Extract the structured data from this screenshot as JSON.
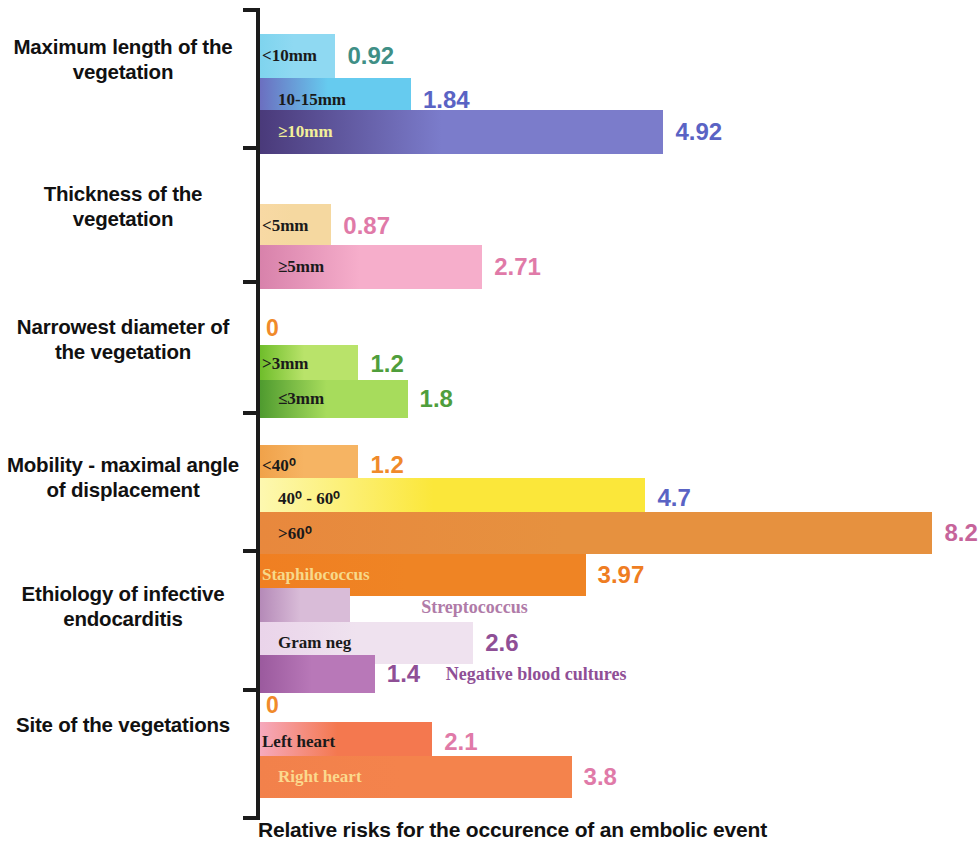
{
  "chart_data": {
    "type": "bar",
    "orientation": "horizontal",
    "title": "",
    "xlabel": "Relative risks for the occurence of an embolic event",
    "ylabel": "",
    "xlim": [
      0,
      8.8
    ],
    "grid": false,
    "legend": "none",
    "groups": [
      {
        "category": "Maximum length of the vegetation",
        "zero_marker": "",
        "bars": [
          {
            "label": "<10mm",
            "value": 0.92,
            "value_text": "0.92",
            "label_color": "#1a1a1a",
            "value_color": "#3f8f86",
            "bar_from": "#7fd4ee",
            "bar_to": "#8fd9f2"
          },
          {
            "label": "10-15mm",
            "value": 1.84,
            "value_text": "1.84",
            "label_color": "#1a1a1a",
            "value_color": "#5a63c4",
            "bar_from": "#6b6fc0",
            "bar_to": "#66cbef"
          },
          {
            "label": "≥10mm",
            "value": 4.92,
            "value_text": "4.92",
            "label_color": "#f2ef9a",
            "value_color": "#5a63c4",
            "bar_from": "#4a3a7a",
            "bar_to": "#7b7ccb"
          }
        ]
      },
      {
        "category": "Thickness of the vegetation",
        "zero_marker": "",
        "bars": [
          {
            "label": "<5mm",
            "value": 0.87,
            "value_text": "0.87",
            "label_color": "#1a1a1a",
            "value_color": "#e07aa8",
            "bar_from": "#f8d9a4",
            "bar_to": "#f5d8a0"
          },
          {
            "label": "≥5mm",
            "value": 2.71,
            "value_text": "2.71",
            "label_color": "#1a1a1a",
            "value_color": "#e07aa8",
            "bar_from": "#d882ab",
            "bar_to": "#f6aecb"
          }
        ]
      },
      {
        "category": "Narrowest diameter of the vegetation",
        "zero_marker": "0",
        "bars": [
          {
            "label": ">3mm",
            "value": 1.2,
            "value_text": "1.2",
            "label_color": "#1a1a1a",
            "value_color": "#4f9e3c",
            "bar_from": "#6fbd2b",
            "bar_to": "#b9e36a"
          },
          {
            "label": "≤3mm",
            "value": 1.8,
            "value_text": "1.8",
            "label_color": "#1a1a1a",
            "value_color": "#4f9e3c",
            "bar_from": "#4f9b2f",
            "bar_to": "#a7dc5c"
          }
        ]
      },
      {
        "category": "Mobility - maximal angle of displacement",
        "zero_marker": "",
        "bars": [
          {
            "label": "<40⁰",
            "value": 1.2,
            "value_text": "1.2",
            "label_color": "#1a1a1a",
            "value_color": "#f08a2a",
            "bar_from": "#f0a24a",
            "bar_to": "#f6b463"
          },
          {
            "label": "40⁰ - 60⁰",
            "value": 4.7,
            "value_text": "4.7",
            "label_color": "#1a1a1a",
            "value_color": "#5a63c4",
            "bar_from": "#fdf8b0",
            "bar_to": "#fbe73a"
          },
          {
            "label": ">60⁰",
            "value": 8.2,
            "value_text": "8.2",
            "label_color": "#1a1a1a",
            "value_color": "#c6649a",
            "bar_from": "#e8883d",
            "bar_to": "#e6913f"
          }
        ]
      },
      {
        "category": "Ethiology of infective endocarditis",
        "zero_marker": "",
        "bars": [
          {
            "label": "Staphilococcus",
            "value": 3.97,
            "value_text": "3.97",
            "label_color": "#f7d98a",
            "value_color": "#ef7d22",
            "bar_from": "#f07f22",
            "bar_to": "#ef8424",
            "outside_label": ""
          },
          {
            "label": "",
            "value": 1.1,
            "value_text": "1.1",
            "label_color": "#1a1a1a",
            "value_color": "#ffffff",
            "bar_from": "#b58ab8",
            "bar_to": "#d9bcd8",
            "outside_label": "Streptococcus",
            "outside_color": "#b07ba8"
          },
          {
            "label": "Gram neg",
            "value": 2.6,
            "value_text": "2.6",
            "label_color": "#1a1a1a",
            "value_color": "#8f4f96",
            "bar_from": "#ead4ea",
            "bar_to": "#efe2ef",
            "outside_label": "",
            "outside_color": "#8f4f96"
          },
          {
            "label": "",
            "value": 1.4,
            "value_text": "1.4",
            "label_color": "#1a1a1a",
            "value_color": "#8f4f96",
            "bar_from": "#9b5a9e",
            "bar_to": "#b878b8",
            "outside_label": "Negative blood cultures",
            "outside_color": "#8f4f96"
          }
        ]
      },
      {
        "category": "Site of the vegetations",
        "zero_marker": "0",
        "bars": [
          {
            "label": "Left heart",
            "value": 2.1,
            "value_text": "2.1",
            "label_color": "#1a1a1a",
            "value_color": "#e07aa8",
            "bar_from": "#f6a9bd",
            "bar_to": "#f4784f"
          },
          {
            "label": "Right heart",
            "value": 3.8,
            "value_text": "3.8",
            "label_color": "#fbd98e",
            "value_color": "#e07aa8",
            "bar_from": "#f2814b",
            "bar_to": "#f4834c"
          }
        ]
      }
    ]
  }
}
